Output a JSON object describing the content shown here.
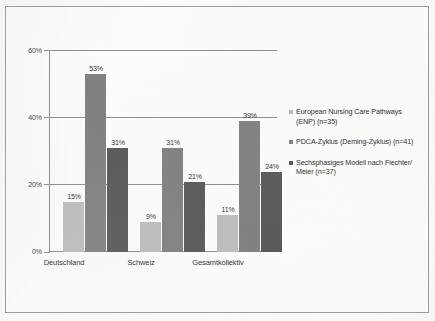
{
  "chart_data": {
    "type": "bar",
    "title": "",
    "subtitle": "",
    "xlabel": "",
    "ylabel": "",
    "ylim": [
      0,
      60
    ],
    "grid": true,
    "legend_position": "right",
    "categories": [
      "Deutschland",
      "Schweiz",
      "Gesamtkollektiv"
    ],
    "y_ticks": [
      "0%",
      "20%",
      "40%",
      "60%"
    ],
    "y_tick_values": [
      0,
      20,
      40,
      60
    ],
    "series": [
      {
        "name": "European Nursing Care Pathways (ENP) (n=35)",
        "color": "#bdbdbd",
        "values": [
          15,
          9,
          11
        ],
        "labels": [
          "15%",
          "9%",
          "11%"
        ]
      },
      {
        "name": "PDCA-Zyklus (Deming-Zyklus) (n=41)",
        "color": "#7f7f7f",
        "values": [
          53,
          31,
          39
        ],
        "labels": [
          "53%",
          "31%",
          "39%"
        ]
      },
      {
        "name": "Sechsphasiges Modell nach Fiechter/ Meier (n=37)",
        "color": "#565656",
        "values": [
          31,
          21,
          24
        ],
        "labels": [
          "31%",
          "21%",
          "24%"
        ]
      }
    ]
  },
  "legend": {
    "items": [
      {
        "marker_name": "legend-marker-enp",
        "label": "European Nursing Care Pathways\n(ENP) (n=35)"
      },
      {
        "marker_name": "legend-marker-pdca",
        "label": "PDCA-Zyklus (Deming-Zyklus) (n=41)"
      },
      {
        "marker_name": "legend-marker-fiechter-meier",
        "label": "Sechsphasiges Modell nach Fiechter/\nMeier (n=37)"
      }
    ]
  }
}
